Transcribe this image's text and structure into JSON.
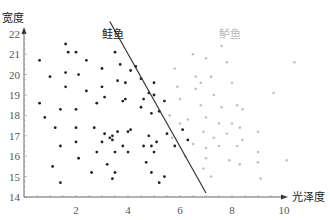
{
  "chart_data": {
    "type": "scatter",
    "title": "",
    "xlabel": "光泽度",
    "ylabel": "宽度",
    "xlim": [
      0,
      10.5
    ],
    "ylim": [
      14,
      22
    ],
    "x_ticks": [
      2,
      4,
      6,
      8,
      10
    ],
    "y_ticks": [
      14,
      15,
      16,
      17,
      18,
      19,
      20,
      21,
      22
    ],
    "grid": false,
    "legend": "none",
    "annotations": [
      {
        "text": "鲑鱼",
        "x": 3.0,
        "y": 21.8,
        "color": "#222222"
      },
      {
        "text": "鲈鱼",
        "x": 7.5,
        "y": 21.8,
        "color": "#bbbbbb"
      }
    ],
    "decision_boundary": {
      "x1": 3.3,
      "y1": 22.6,
      "x2": 7.0,
      "y2": 14.2,
      "color": "#333333"
    },
    "series": [
      {
        "name": "鲑鱼",
        "color": "#222222",
        "points": [
          [
            1.6,
            21.5
          ],
          [
            1.7,
            21.1
          ],
          [
            2.0,
            21.1
          ],
          [
            0.6,
            20.7
          ],
          [
            2.4,
            20.7
          ],
          [
            3.5,
            21.1
          ],
          [
            1.0,
            19.9
          ],
          [
            1.6,
            20.1
          ],
          [
            2.1,
            20.0
          ],
          [
            3.0,
            20.3
          ],
          [
            3.7,
            20.5
          ],
          [
            4.1,
            20.2
          ],
          [
            1.6,
            19.4
          ],
          [
            2.4,
            19.2
          ],
          [
            3.0,
            19.4
          ],
          [
            3.6,
            19.7
          ],
          [
            3.9,
            19.6
          ],
          [
            4.5,
            19.8
          ],
          [
            3.1,
            18.9
          ],
          [
            3.9,
            18.8
          ],
          [
            3.8,
            18.7
          ],
          [
            4.8,
            19.1
          ],
          [
            0.6,
            18.6
          ],
          [
            1.4,
            18.3
          ],
          [
            2.0,
            18.3
          ],
          [
            2.8,
            18.6
          ],
          [
            4.5,
            18.4
          ],
          [
            4.9,
            18.1
          ],
          [
            5.0,
            19.6
          ],
          [
            0.8,
            17.9
          ],
          [
            1.2,
            17.4
          ],
          [
            2.0,
            17.4
          ],
          [
            2.7,
            17.4
          ],
          [
            3.1,
            17.1
          ],
          [
            3.4,
            17.0
          ],
          [
            3.6,
            17.2
          ],
          [
            4.1,
            17.3
          ],
          [
            4.0,
            17.2
          ],
          [
            2.0,
            16.7
          ],
          [
            3.0,
            16.7
          ],
          [
            3.3,
            16.9
          ],
          [
            3.4,
            16.8
          ],
          [
            3.8,
            16.5
          ],
          [
            4.6,
            16.5
          ],
          [
            4.8,
            17.0
          ],
          [
            4.9,
            16.5
          ],
          [
            5.1,
            16.7
          ],
          [
            1.4,
            16.5
          ],
          [
            2.8,
            16.2
          ],
          [
            3.5,
            16.2
          ],
          [
            4.0,
            16.2
          ],
          [
            5.0,
            16.2
          ],
          [
            2.1,
            15.9
          ],
          [
            1.1,
            15.5
          ],
          [
            3.2,
            15.6
          ],
          [
            4.7,
            15.7
          ],
          [
            4.9,
            15.2
          ],
          [
            2.6,
            15.2
          ],
          [
            3.5,
            15.2
          ],
          [
            3.4,
            14.9
          ],
          [
            5.4,
            15.0
          ],
          [
            1.4,
            14.7
          ],
          [
            5.2,
            14.7
          ],
          [
            4.3,
            20.4
          ],
          [
            5.2,
            18.2
          ],
          [
            4.6,
            18.8
          ],
          [
            5.8,
            16.5
          ],
          [
            5.5,
            17.1
          ],
          [
            6.1,
            17.3
          ],
          [
            6.3,
            16.8
          ],
          [
            5.0,
            19.0
          ],
          [
            5.4,
            18.7
          ]
        ]
      },
      {
        "name": "鲈鱼",
        "color": "#c0c0c0",
        "points": [
          [
            6.5,
            21.0
          ],
          [
            7.0,
            20.8
          ],
          [
            7.8,
            20.6
          ],
          [
            5.8,
            20.3
          ],
          [
            6.6,
            19.9
          ],
          [
            7.2,
            19.9
          ],
          [
            8.0,
            19.6
          ],
          [
            5.9,
            19.4
          ],
          [
            6.6,
            19.3
          ],
          [
            7.3,
            19.0
          ],
          [
            9.6,
            19.1
          ],
          [
            6.0,
            18.8
          ],
          [
            6.8,
            18.5
          ],
          [
            7.6,
            18.4
          ],
          [
            8.2,
            18.5
          ],
          [
            8.4,
            18.3
          ],
          [
            5.6,
            18.0
          ],
          [
            6.3,
            17.8
          ],
          [
            7.0,
            17.9
          ],
          [
            7.5,
            17.6
          ],
          [
            8.0,
            17.6
          ],
          [
            8.3,
            17.4
          ],
          [
            9.0,
            17.2
          ],
          [
            6.0,
            17.6
          ],
          [
            6.9,
            17.2
          ],
          [
            7.3,
            16.9
          ],
          [
            7.8,
            17.1
          ],
          [
            8.4,
            16.8
          ],
          [
            6.5,
            16.6
          ],
          [
            7.0,
            16.4
          ],
          [
            7.5,
            16.5
          ],
          [
            8.2,
            16.5
          ],
          [
            5.7,
            16.9
          ],
          [
            6.2,
            16.0
          ],
          [
            7.0,
            15.9
          ],
          [
            7.9,
            15.8
          ],
          [
            9.0,
            16.2
          ],
          [
            10.1,
            15.8
          ],
          [
            6.9,
            15.4
          ],
          [
            8.3,
            15.6
          ],
          [
            9.0,
            15.7
          ],
          [
            7.2,
            15.0
          ],
          [
            9.1,
            14.9
          ],
          [
            10.4,
            20.6
          ],
          [
            7.6,
            21.4
          ],
          [
            6.8,
            19.6
          ]
        ]
      }
    ]
  }
}
